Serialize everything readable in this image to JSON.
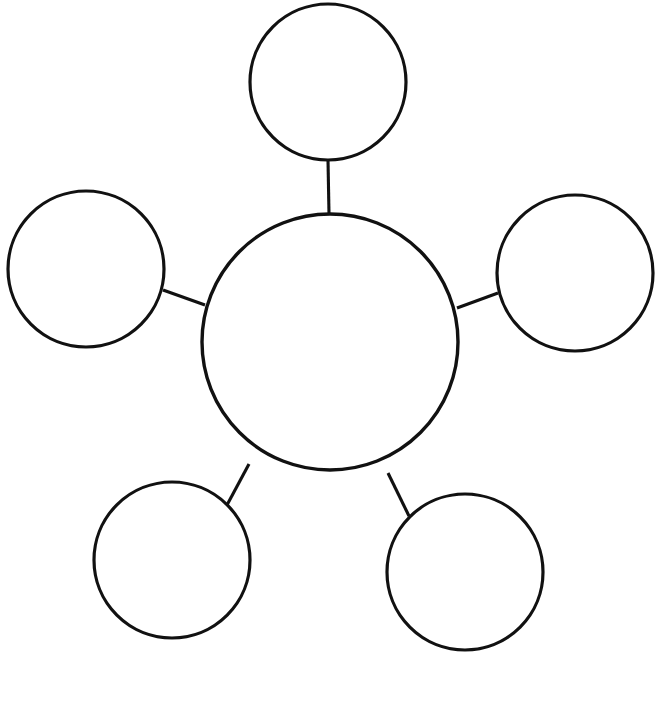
{
  "page": {
    "background_color": "#ffffff",
    "width": 667,
    "height": 711
  },
  "diagram": {
    "type": "spider-concept-map",
    "stroke_color": "#111111",
    "fill_color": "#ffffff",
    "center_node": {
      "name": "center-node",
      "label": "",
      "cx": 330,
      "cy": 342,
      "r": 128
    },
    "satellite_nodes": [
      {
        "name": "node-top",
        "label": "",
        "cx": 328,
        "cy": 82,
        "r": 78
      },
      {
        "name": "node-left",
        "label": "",
        "cx": 86,
        "cy": 269,
        "r": 78
      },
      {
        "name": "node-right",
        "label": "",
        "cx": 575,
        "cy": 273,
        "r": 78
      },
      {
        "name": "node-bottom-left",
        "label": "",
        "cx": 172,
        "cy": 560,
        "r": 78
      },
      {
        "name": "node-bottom-right",
        "label": "",
        "cx": 465,
        "cy": 572,
        "r": 78
      }
    ],
    "connectors": [
      {
        "name": "connector-top",
        "x1": 328,
        "y1": 160,
        "x2": 329,
        "y2": 214
      },
      {
        "name": "connector-left",
        "x1": 163,
        "y1": 290,
        "x2": 205,
        "y2": 305
      },
      {
        "name": "connector-right",
        "x1": 457,
        "y1": 308,
        "x2": 498,
        "y2": 293
      },
      {
        "name": "connector-bottom-left",
        "x1": 227,
        "y1": 505,
        "x2": 249,
        "y2": 464
      },
      {
        "name": "connector-bottom-right",
        "x1": 409,
        "y1": 516,
        "x2": 388,
        "y2": 473
      }
    ]
  },
  "attribution": {
    "edge_text": "© Copyright"
  }
}
